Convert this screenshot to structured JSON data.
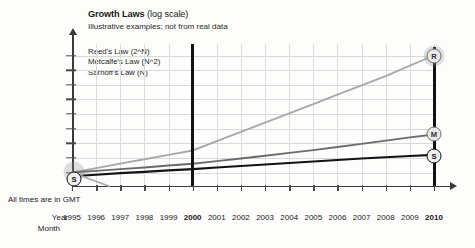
{
  "chart_data": {
    "type": "line",
    "title": "Growth Laws",
    "title_suffix": "(log scale)",
    "subtitle": "Illustrative examples; not from real data",
    "xlabel": "Year",
    "ylabel": "",
    "yscale": "log",
    "ylim": [
      1,
      100000000
    ],
    "grid": true,
    "legend_position": "upper-left-inside",
    "note": "All times are in GMT",
    "row_labels": {
      "year": "Year",
      "month": "Month"
    },
    "ytick_labels": [
      "100,000,000",
      "10,000,000",
      "1,000,000",
      "100,000",
      "10,000",
      "1,000",
      "100",
      "10",
      "1"
    ],
    "ytick_values": [
      100000000,
      10000000,
      1000000,
      100000,
      10000,
      1000,
      100,
      10,
      1
    ],
    "categories": [
      "1995",
      "1996",
      "1997",
      "1998",
      "1999",
      "2000",
      "2001",
      "2002",
      "2003",
      "2004",
      "2005",
      "2006",
      "2007",
      "2008",
      "2009",
      "2010"
    ],
    "bold_categories": [
      "2000",
      "2010"
    ],
    "series": [
      {
        "name": "Reed's Law (2^N)",
        "marker_label": "R",
        "color": "#a8a8a8",
        "values": [
          1,
          2,
          4,
          8,
          16,
          32,
          140,
          600,
          2600,
          11000,
          48000,
          210000,
          900000,
          3900000,
          20000000,
          100000000
        ]
      },
      {
        "name": "Metcalfe's Law (N^2)",
        "marker_label": "M",
        "color": "#6b6b6b",
        "values": [
          1,
          1.3,
          1.7,
          2.2,
          3,
          4,
          6,
          9,
          14,
          22,
          34,
          55,
          90,
          150,
          250,
          400
        ]
      },
      {
        "name": "Sarnoff's Law (N)",
        "marker_label": "S",
        "color": "#121212",
        "values": [
          0.55,
          0.7,
          0.9,
          1.1,
          1.4,
          1.7,
          2.2,
          2.8,
          3.5,
          4.5,
          5.7,
          7.2,
          9,
          11,
          13.5,
          16
        ]
      }
    ],
    "vertical_marker_years": [
      "2000",
      "2010"
    ],
    "start_marker": {
      "label": "S",
      "year": "1995"
    },
    "end_markers": [
      {
        "label": "R",
        "year": "2010"
      },
      {
        "label": "M",
        "year": "2010"
      },
      {
        "label": "S",
        "year": "2010"
      }
    ]
  }
}
